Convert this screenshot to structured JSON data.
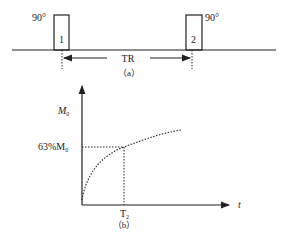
{
  "figure_a": {
    "pulse1": {
      "angle_label": "90°",
      "number": "1"
    },
    "pulse2": {
      "angle_label": "90°",
      "number": "2"
    },
    "interval_label": "TR",
    "caption": "（a）"
  },
  "figure_b": {
    "y_axis_label": "M",
    "y_axis_sub": "0",
    "level_label_prefix": "63%M",
    "level_label_sub": "0",
    "x_axis_label": "t",
    "x_tick_label": "T",
    "x_tick_sub": "2",
    "caption": "（b）"
  },
  "colors": {
    "stroke": "#222222",
    "background": "#ffffff"
  }
}
